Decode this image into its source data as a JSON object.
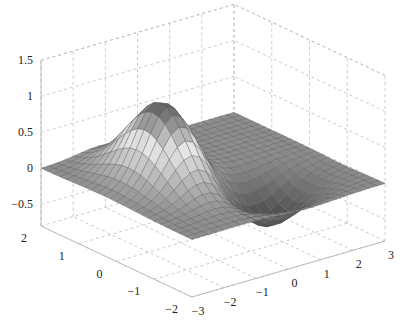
{
  "chart_data": {
    "type": "surface3d",
    "title": "",
    "xlabel": "",
    "ylabel": "",
    "zlabel": "",
    "x_ticks": [
      -3,
      -2,
      -1,
      0,
      1,
      2,
      3
    ],
    "y_ticks": [
      -2,
      -1,
      0,
      1,
      2
    ],
    "z_ticks": [
      -0.5,
      0,
      0.5,
      1,
      1.5
    ],
    "x_tick_labels": [
      "-3",
      "-2",
      "-1",
      "0",
      "1",
      "2",
      "3"
    ],
    "y_tick_labels": [
      "-2",
      "-1",
      "0",
      "1",
      "2"
    ],
    "z_tick_labels": [
      "-0.5",
      "0",
      "0.5",
      "1",
      "1.5"
    ],
    "xlim": [
      -3,
      3
    ],
    "ylim": [
      -2,
      2
    ],
    "zlim": [
      -0.8,
      1.5
    ],
    "grid": true,
    "grid_style": "dashed",
    "colormap": "gray",
    "mesh_resolution": [
      25,
      25
    ],
    "surface_features": [
      {
        "kind": "peak",
        "x": -1.2,
        "y": 0.3,
        "z": 1.1
      },
      {
        "kind": "trough",
        "x": 0.6,
        "y": -0.9,
        "z": -0.55
      }
    ]
  },
  "colors": {
    "grid": "#bdbdbd",
    "axis": "#bdbdbd",
    "mesh_edge": "#555555",
    "background": "#ffffff"
  }
}
